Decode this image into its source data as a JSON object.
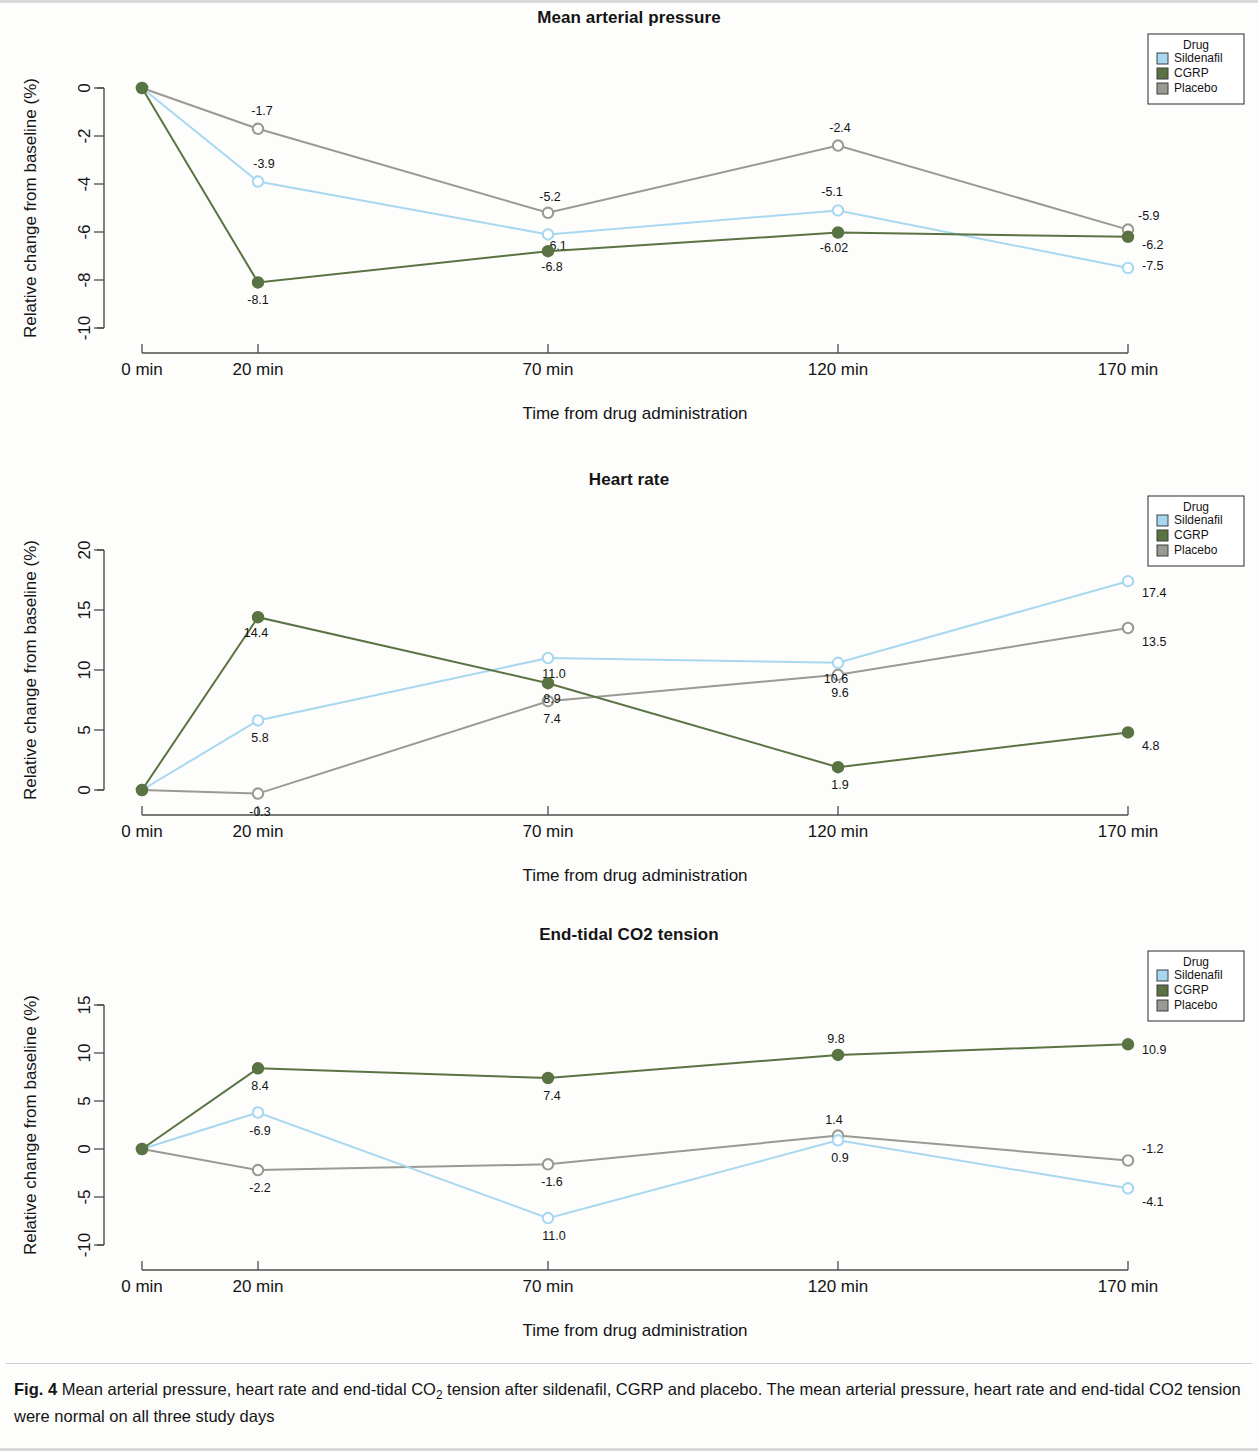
{
  "figure": {
    "caption_label": "Fig. 4",
    "caption_text_part1": "Mean arterial pressure, heart rate and end-tidal CO",
    "caption_sub": "2",
    "caption_text_part2": " tension after sildenafil, CGRP and placebo. The mean arterial pressure, heart rate and end-tidal CO2 tension were normal on all three study days"
  },
  "legend": {
    "title": "Drug",
    "entries": [
      {
        "label": "Sildenafil",
        "color": "#a8d8f0"
      },
      {
        "label": "CGRP",
        "color": "#5a7343"
      },
      {
        "label": "Placebo",
        "color": "#9a9a93"
      }
    ]
  },
  "axis": {
    "xlabel": "Time from drug administration",
    "ylabel": "Relative change from baseline (%)",
    "xticks": [
      "0 min",
      "20 min",
      "70 min",
      "120 min",
      "170 min"
    ]
  },
  "colors": {
    "sildenafil": "#a8d8f0",
    "cgrp": "#5a7343",
    "placebo": "#9a9a93",
    "axis": "#4c4c4c",
    "text": "#141414",
    "background": "#fdfdfc"
  },
  "chart_data": [
    {
      "type": "line",
      "title": "Mean arterial pressure",
      "xlabel": "Time from drug administration",
      "ylabel": "Relative change from baseline (%)",
      "categories": [
        "0 min",
        "20 min",
        "70 min",
        "120 min",
        "170 min"
      ],
      "x": [
        0,
        20,
        70,
        120,
        170
      ],
      "yticks": [
        0,
        -2,
        -4,
        -6,
        -8,
        -10
      ],
      "ylim": [
        -10,
        0
      ],
      "grid": false,
      "legend_position": "top-right",
      "series": [
        {
          "name": "Sildenafil",
          "color": "#a8d8f0",
          "values": [
            0,
            -3.9,
            -6.1,
            -5.1,
            -7.5
          ],
          "labels": [
            "",
            "-3.9",
            "-6.1",
            "-5.1",
            "-7.5"
          ]
        },
        {
          "name": "CGRP",
          "color": "#5a7343",
          "values": [
            0,
            -8.1,
            -6.8,
            -6.02,
            -6.2
          ],
          "labels": [
            "",
            "-8.1",
            "-6.8",
            "-6.02",
            "-6.2"
          ]
        },
        {
          "name": "Placebo",
          "color": "#9a9a93",
          "values": [
            0,
            -1.7,
            -5.2,
            -2.4,
            -5.9
          ],
          "labels": [
            "",
            "-1.7",
            "-5.2",
            "-2.4",
            "-5.9"
          ]
        }
      ]
    },
    {
      "type": "line",
      "title": "Heart rate",
      "xlabel": "Time from drug administration",
      "ylabel": "Relative change from baseline (%)",
      "categories": [
        "0 min",
        "20 min",
        "70 min",
        "120 min",
        "170 min"
      ],
      "x": [
        0,
        20,
        70,
        120,
        170
      ],
      "yticks": [
        20,
        15,
        10,
        5,
        0
      ],
      "ylim": [
        0,
        20
      ],
      "grid": false,
      "legend_position": "top-right",
      "series": [
        {
          "name": "Sildenafil",
          "color": "#a8d8f0",
          "values": [
            0,
            5.8,
            11.0,
            10.6,
            17.4
          ],
          "labels": [
            "",
            "5.8",
            "11.0",
            "10.6",
            "17.4"
          ]
        },
        {
          "name": "CGRP",
          "color": "#5a7343",
          "values": [
            0,
            14.4,
            8.9,
            1.9,
            4.8
          ],
          "labels": [
            "",
            "14.4",
            "8.9",
            "1.9",
            "4.8"
          ]
        },
        {
          "name": "Placebo",
          "color": "#9a9a93",
          "values": [
            0,
            -0.3,
            7.4,
            9.6,
            13.5
          ],
          "labels": [
            "",
            "-0.3",
            "7.4",
            "9.6",
            "13.5"
          ]
        }
      ]
    },
    {
      "type": "line",
      "title": "End-tidal CO2 tension",
      "xlabel": "Time from drug administration",
      "ylabel": "Relative change from baseline (%)",
      "categories": [
        "0 min",
        "20 min",
        "70 min",
        "120 min",
        "170 min"
      ],
      "x": [
        0,
        20,
        70,
        120,
        170
      ],
      "yticks": [
        15,
        10,
        5,
        0,
        -5,
        -10
      ],
      "ylim": [
        -10,
        15
      ],
      "grid": false,
      "legend_position": "top-right",
      "series": [
        {
          "name": "Sildenafil",
          "color": "#a8d8f0",
          "values": [
            0,
            3.8,
            -7.2,
            0.9,
            -4.1
          ],
          "labels": [
            "",
            "-6.9",
            "11.0",
            "0.9",
            "-4.1"
          ]
        },
        {
          "name": "CGRP",
          "color": "#5a7343",
          "values": [
            0,
            8.4,
            7.4,
            9.8,
            10.9
          ],
          "labels": [
            "",
            "8.4",
            "7.4",
            "9.8",
            "10.9"
          ]
        },
        {
          "name": "Placebo",
          "color": "#9a9a93",
          "values": [
            0,
            -2.2,
            -1.6,
            1.4,
            -1.2
          ],
          "labels": [
            "",
            "-2.2",
            "-1.6",
            "1.4",
            "-1.2"
          ]
        }
      ]
    }
  ],
  "label_offsets": [
    [
      [
        [
          0,
          0
        ],
        [
          6,
          -14
        ],
        [
          8,
          16
        ],
        [
          -6,
          -14
        ],
        [
          14,
          2
        ]
      ],
      [
        [
          0,
          0
        ],
        [
          0,
          22
        ],
        [
          4,
          20
        ],
        [
          -4,
          20
        ],
        [
          14,
          12
        ]
      ],
      [
        [
          0,
          0
        ],
        [
          4,
          -14
        ],
        [
          2,
          -12
        ],
        [
          2,
          -14
        ],
        [
          10,
          -10
        ]
      ]
    ],
    [
      [
        [
          0,
          0
        ],
        [
          2,
          22
        ],
        [
          6,
          20
        ],
        [
          -2,
          20
        ],
        [
          14,
          16
        ]
      ],
      [
        [
          0,
          0
        ],
        [
          -2,
          20
        ],
        [
          4,
          20
        ],
        [
          2,
          22
        ],
        [
          14,
          18
        ]
      ],
      [
        [
          0,
          0
        ],
        [
          2,
          22
        ],
        [
          4,
          22
        ],
        [
          2,
          22
        ],
        [
          14,
          18
        ]
      ]
    ],
    [
      [
        [
          0,
          0
        ],
        [
          2,
          22
        ],
        [
          6,
          22
        ],
        [
          2,
          22
        ],
        [
          14,
          18
        ]
      ],
      [
        [
          0,
          0
        ],
        [
          2,
          22
        ],
        [
          4,
          22
        ],
        [
          -2,
          -12
        ],
        [
          14,
          10
        ]
      ],
      [
        [
          0,
          0
        ],
        [
          2,
          22
        ],
        [
          4,
          22
        ],
        [
          -4,
          -12
        ],
        [
          14,
          -8
        ]
      ]
    ]
  ]
}
